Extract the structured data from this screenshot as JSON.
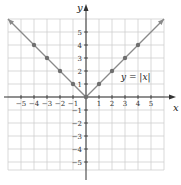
{
  "chart_data": {
    "type": "line",
    "title": "",
    "function": "y = |x|",
    "xlabel": "x",
    "ylabel": "y",
    "xlim": [
      -6,
      6
    ],
    "ylim": [
      -6,
      6
    ],
    "grid": true,
    "x_ticks": [
      -5,
      -4,
      -3,
      -2,
      -1,
      1,
      2,
      3,
      4,
      5
    ],
    "y_ticks": [
      -5,
      -4,
      -3,
      -2,
      -1,
      1,
      2,
      3,
      4,
      5
    ],
    "x_tick_labels": [
      "−5",
      "−4",
      "−3",
      "−2",
      "−1",
      "1",
      "2",
      "3",
      "4",
      "5"
    ],
    "y_tick_labels": [
      "−5",
      "−4",
      "−3",
      "−2",
      "−1",
      "1",
      "2",
      "3",
      "4",
      "5"
    ],
    "series": [
      {
        "name": "y = |x|",
        "x": [
          -6,
          -4,
          -3,
          -2,
          -1,
          0,
          1,
          2,
          3,
          4,
          6
        ],
        "y": [
          6,
          4,
          3,
          2,
          1,
          0,
          1,
          2,
          3,
          4,
          6
        ],
        "marked_points": [
          [
            -4,
            4
          ],
          [
            -3,
            3
          ],
          [
            -2,
            2
          ],
          [
            -1,
            1
          ],
          [
            0,
            0
          ],
          [
            1,
            1
          ],
          [
            2,
            2
          ],
          [
            3,
            3
          ],
          [
            4,
            4
          ]
        ],
        "arrows_at_ends": true,
        "color": "#8a8a8a"
      }
    ],
    "annotations": [
      {
        "text": "y = |x|",
        "x": 3.5,
        "y": 1.8
      }
    ],
    "colors": {
      "grid": "#cfcfcf",
      "axis": "#333333",
      "line": "#8a8a8a",
      "point": "#6f6f6f"
    }
  },
  "labels": {
    "x_axis": "x",
    "y_axis": "y",
    "equation_y": "y",
    "equation_eq": " = |",
    "equation_x": "x",
    "equation_close": "|"
  }
}
